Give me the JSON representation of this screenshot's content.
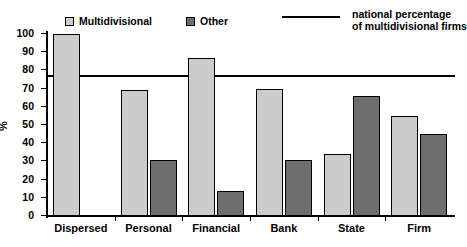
{
  "legend": {
    "series1_label": "Multidivisional",
    "series2_label": "Other",
    "line_label_line1": "national percentage",
    "line_label_line2": "of multidivisional firms"
  },
  "axis": {
    "ylabel": "%",
    "yticks": [
      "100",
      "90",
      "80",
      "70",
      "60",
      "50",
      "40",
      "30",
      "20",
      "10",
      "0"
    ]
  },
  "colors": {
    "series1": "#cccccc",
    "series2": "#6e6e6e",
    "outline": "#000000",
    "reference_line": "#000000",
    "background": "#ffffff"
  },
  "chart_data": {
    "type": "bar",
    "title": "",
    "xlabel": "",
    "ylabel": "%",
    "ylim": [
      0,
      100
    ],
    "ytick_step": 10,
    "grid": false,
    "legend_position": "top",
    "categories": [
      "Dispersed",
      "Personal",
      "Financial",
      "Bank",
      "State",
      "Firm"
    ],
    "series": [
      {
        "name": "Multidivisional",
        "color": "#cccccc",
        "values": [
          100,
          69,
          87,
          70,
          34,
          55
        ]
      },
      {
        "name": "Other",
        "color": "#6e6e6e",
        "values": [
          null,
          31,
          14,
          31,
          66,
          45
        ]
      }
    ],
    "reference_line": {
      "label": "national percentage of multidivisional firms",
      "value": 77,
      "orientation": "horizontal"
    }
  }
}
